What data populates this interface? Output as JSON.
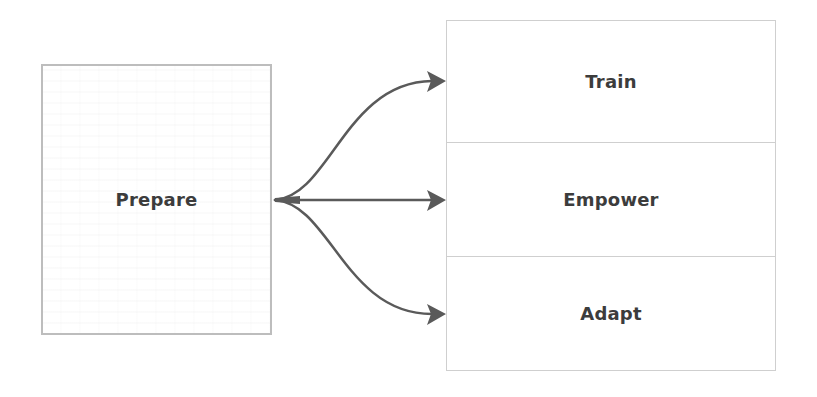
{
  "diagram": {
    "type": "flow",
    "source": {
      "label": "Prepare"
    },
    "targets": [
      {
        "label": "Train"
      },
      {
        "label": "Empower"
      },
      {
        "label": "Adapt"
      }
    ],
    "colors": {
      "arrow": "#5a5a5a",
      "text": "#3c3c3c",
      "source_border": "#bdbdbd",
      "target_border": "#cfcfcf",
      "background": "#ffffff"
    }
  }
}
